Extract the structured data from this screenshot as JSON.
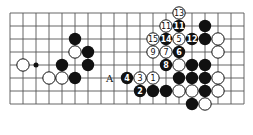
{
  "diagram": {
    "type": "go-board-partial",
    "grid": {
      "cols": 19,
      "rows": 8,
      "x0": 10,
      "y0": 13,
      "spacing": 13
    },
    "label": {
      "text": "A",
      "col": 7,
      "row": 5
    },
    "stones": [
      {
        "color": "white",
        "col": 13,
        "row": 0,
        "num": "13"
      },
      {
        "color": "white",
        "col": 12,
        "row": 1,
        "num": "11"
      },
      {
        "color": "black",
        "col": 13,
        "row": 1,
        "num": "11"
      },
      {
        "color": "black",
        "col": 15,
        "row": 1,
        "num": ""
      },
      {
        "color": "white",
        "col": 11,
        "row": 2,
        "num": "15"
      },
      {
        "color": "black",
        "col": 12,
        "row": 2,
        "num": "14"
      },
      {
        "color": "white",
        "col": 13,
        "row": 2,
        "num": "5"
      },
      {
        "color": "black",
        "col": 14,
        "row": 2,
        "num": "12"
      },
      {
        "color": "black",
        "col": 15,
        "row": 2,
        "num": ""
      },
      {
        "color": "white",
        "col": 16,
        "row": 2,
        "num": ""
      },
      {
        "color": "white",
        "col": 11,
        "row": 3,
        "num": "9"
      },
      {
        "color": "white",
        "col": 12,
        "row": 3,
        "num": "7"
      },
      {
        "color": "black",
        "col": 13,
        "row": 3,
        "num": "6"
      },
      {
        "color": "white",
        "col": 16,
        "row": 3,
        "num": ""
      },
      {
        "color": "black",
        "col": 5,
        "row": 2,
        "num": ""
      },
      {
        "color": "white",
        "col": 5,
        "row": 3,
        "num": ""
      },
      {
        "color": "black",
        "col": 6,
        "row": 3,
        "num": ""
      },
      {
        "color": "white",
        "col": 1,
        "row": 4,
        "num": ""
      },
      {
        "color": "black",
        "col": 4,
        "row": 4,
        "num": ""
      },
      {
        "color": "black",
        "col": 6,
        "row": 4,
        "num": ""
      },
      {
        "color": "white",
        "col": 3,
        "row": 5,
        "num": ""
      },
      {
        "color": "white",
        "col": 4,
        "row": 5,
        "num": ""
      },
      {
        "color": "black",
        "col": 5,
        "row": 5,
        "num": ""
      },
      {
        "color": "black",
        "col": 12,
        "row": 4,
        "num": "8"
      },
      {
        "color": "white",
        "col": 13,
        "row": 4,
        "num": ""
      },
      {
        "color": "black",
        "col": 14,
        "row": 4,
        "num": ""
      },
      {
        "color": "black",
        "col": 15,
        "row": 4,
        "num": ""
      },
      {
        "color": "black",
        "col": 9,
        "row": 5,
        "num": "4"
      },
      {
        "color": "white",
        "col": 10,
        "row": 5,
        "num": "3"
      },
      {
        "color": "white",
        "col": 11,
        "row": 5,
        "num": "1"
      },
      {
        "color": "black",
        "col": 13,
        "row": 5,
        "num": ""
      },
      {
        "color": "black",
        "col": 14,
        "row": 5,
        "num": ""
      },
      {
        "color": "black",
        "col": 15,
        "row": 5,
        "num": ""
      },
      {
        "color": "white",
        "col": 16,
        "row": 5,
        "num": ""
      },
      {
        "color": "black",
        "col": 10,
        "row": 6,
        "num": "2"
      },
      {
        "color": "black",
        "col": 11,
        "row": 6,
        "num": ""
      },
      {
        "color": "black",
        "col": 12,
        "row": 6,
        "num": ""
      },
      {
        "color": "white",
        "col": 13,
        "row": 6,
        "num": ""
      },
      {
        "color": "white",
        "col": 14,
        "row": 6,
        "num": ""
      },
      {
        "color": "black",
        "col": 15,
        "row": 6,
        "num": ""
      },
      {
        "color": "white",
        "col": 16,
        "row": 6,
        "num": ""
      },
      {
        "color": "black",
        "col": 14,
        "row": 7,
        "num": ""
      },
      {
        "color": "white",
        "col": 15,
        "row": 7,
        "num": ""
      }
    ],
    "dot": {
      "col": 2,
      "row": 4
    }
  }
}
